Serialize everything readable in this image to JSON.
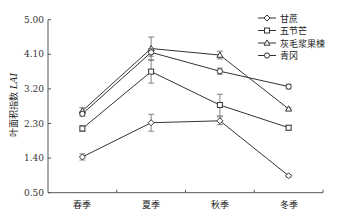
{
  "chart_data": {
    "type": "line",
    "title": "",
    "xlabel": "",
    "ylabel": "叶面积指数 LAI",
    "ylabel_main": "叶面积指数 ",
    "ylabel_italic": "LAI",
    "categories": [
      "春季",
      "夏季",
      "秋季",
      "冬季"
    ],
    "yticks": [
      "0.50",
      "1.40",
      "2.30",
      "3.20",
      "4.10",
      "5.00"
    ],
    "ylim": [
      0.5,
      5.0
    ],
    "grid": false,
    "legend_position": "top-right",
    "series": [
      {
        "name": "甘蔗",
        "marker": "diamond",
        "values": [
          1.43,
          2.32,
          2.37,
          0.94
        ],
        "errors": [
          0.08,
          0.22,
          0.1,
          0.03
        ]
      },
      {
        "name": "五节芒",
        "marker": "square",
        "values": [
          2.17,
          3.65,
          2.78,
          2.19
        ],
        "errors": [
          0.07,
          0.3,
          0.28,
          0.06
        ]
      },
      {
        "name": "灰毛浆果楝",
        "marker": "triangle",
        "values": [
          2.63,
          4.25,
          4.08,
          2.68
        ],
        "errors": [
          0.08,
          0.3,
          0.1,
          0.03
        ]
      },
      {
        "name": "青冈",
        "marker": "circle",
        "values": [
          2.55,
          4.15,
          3.66,
          3.26
        ],
        "errors": [
          0.06,
          0.1,
          0.08,
          0.06
        ]
      }
    ]
  },
  "legend": {
    "items": [
      "甘蔗",
      "五节芒",
      "灰毛浆果楝",
      "青冈"
    ]
  },
  "colors": {
    "line": "#333333",
    "axis": "#555555"
  }
}
